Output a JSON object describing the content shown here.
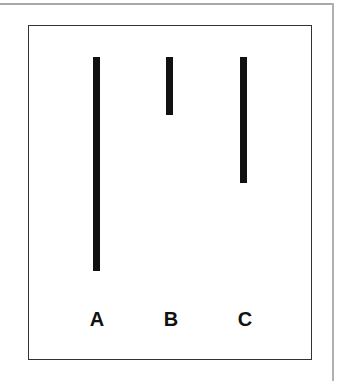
{
  "figure": {
    "lines": [
      {
        "label": "A",
        "x": 93,
        "top": 57,
        "bottom": 271
      },
      {
        "label": "B",
        "x": 166,
        "top": 57,
        "bottom": 115
      },
      {
        "label": "C",
        "x": 240,
        "top": 57,
        "bottom": 183
      }
    ],
    "labels": [
      "A",
      "B",
      "C"
    ]
  }
}
